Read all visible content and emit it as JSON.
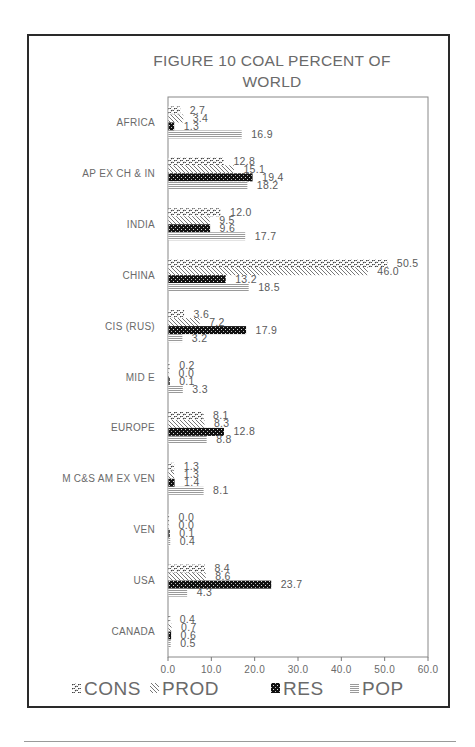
{
  "chart_data": {
    "type": "bar",
    "orientation": "horizontal",
    "title": "FIGURE 10 COAL PERCENT OF WORLD",
    "title_lines": [
      "FIGURE 10 COAL PERCENT OF",
      "WORLD"
    ],
    "xlabel": "",
    "ylabel": "",
    "xlim": [
      0,
      60
    ],
    "xticks": [
      "0.0",
      "10.0",
      "20.0",
      "30.0",
      "40.0",
      "50.0",
      "60.0"
    ],
    "grid": false,
    "legend": "bottom",
    "categories": [
      "AFRICA",
      "AP EX CH & IN",
      "INDIA",
      "CHINA",
      "CIS (RUS)",
      "MID E",
      "EUROPE",
      "M  C&S AM EX VEN",
      "VEN",
      "USA",
      "CANADA"
    ],
    "series": [
      {
        "name": "CONS",
        "pattern": "squiggle-dots",
        "values": [
          2.7,
          12.8,
          12.0,
          50.5,
          3.6,
          0.2,
          8.1,
          1.3,
          0.0,
          8.4,
          0.4
        ]
      },
      {
        "name": "PROD",
        "pattern": "diagonal-hatch",
        "values": [
          3.4,
          15.1,
          9.5,
          46.0,
          7.2,
          0.0,
          8.3,
          1.3,
          0.0,
          8.6,
          0.7
        ]
      },
      {
        "name": "RES",
        "pattern": "dark-dots",
        "values": [
          1.3,
          19.4,
          9.6,
          13.2,
          17.9,
          0.1,
          12.8,
          1.4,
          0.1,
          23.7,
          0.6
        ]
      },
      {
        "name": "POP",
        "pattern": "horizontal-lines",
        "values": [
          16.9,
          18.2,
          17.7,
          18.5,
          3.2,
          3.3,
          8.8,
          8.1,
          0.4,
          4.3,
          0.5
        ]
      }
    ]
  },
  "colors": {
    "text": "#6a6a6a",
    "bar_dark": "#1a1a1a",
    "bar_hatch": "#808080",
    "frame": "#2a2a2a"
  }
}
